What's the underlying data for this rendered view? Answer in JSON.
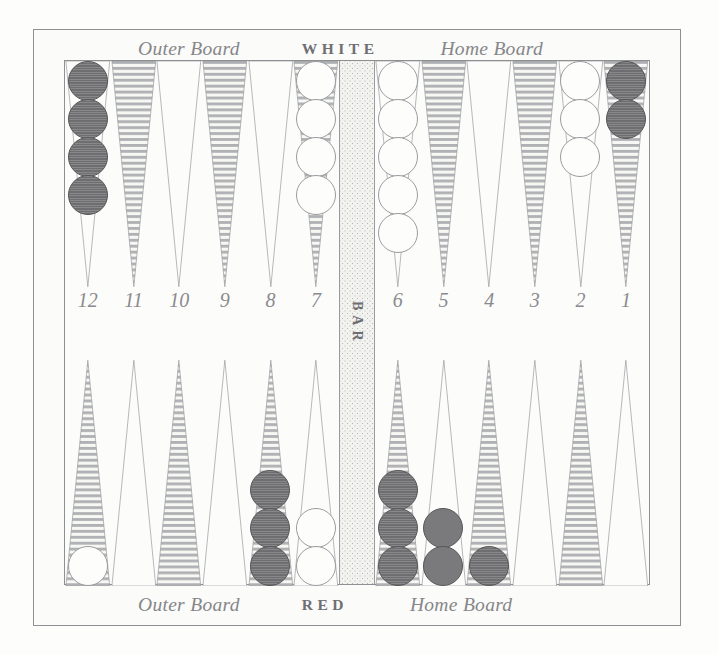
{
  "board": {
    "top_caption": {
      "outer": "Outer Board",
      "player": "WHITE",
      "home": "Home Board"
    },
    "bottom_caption": {
      "outer": "Outer Board",
      "player": "RED",
      "home": "Home Board"
    },
    "bar_label": "BAR",
    "point_numbers": [
      "12",
      "11",
      "10",
      "9",
      "8",
      "7",
      "6",
      "5",
      "4",
      "3",
      "2",
      "1"
    ],
    "colors": {
      "frame": "#8f9094",
      "paper": "#fbfbf9",
      "point_hatch": "#b0b1b4",
      "point_plain": "#fcfcfa",
      "checker_white": "#fdfdfb",
      "checker_red": "#6e6e70",
      "bar_stipple": "#b4b5b8",
      "text": "#86868a"
    },
    "top_points": [
      {
        "number": "12",
        "fill": "plain",
        "checkers": {
          "color": "red",
          "count": 4
        }
      },
      {
        "number": "11",
        "fill": "hatched",
        "checkers": {
          "color": "none",
          "count": 0
        }
      },
      {
        "number": "10",
        "fill": "plain",
        "checkers": {
          "color": "none",
          "count": 0
        }
      },
      {
        "number": "9",
        "fill": "hatched",
        "checkers": {
          "color": "none",
          "count": 0
        }
      },
      {
        "number": "8",
        "fill": "plain",
        "checkers": {
          "color": "none",
          "count": 0
        }
      },
      {
        "number": "7",
        "fill": "hatched",
        "checkers": {
          "color": "white",
          "count": 4
        }
      },
      {
        "number": "6",
        "fill": "plain",
        "checkers": {
          "color": "white",
          "count": 5
        }
      },
      {
        "number": "5",
        "fill": "hatched",
        "checkers": {
          "color": "none",
          "count": 0
        }
      },
      {
        "number": "4",
        "fill": "plain",
        "checkers": {
          "color": "none",
          "count": 0
        }
      },
      {
        "number": "3",
        "fill": "hatched",
        "checkers": {
          "color": "none",
          "count": 0
        }
      },
      {
        "number": "2",
        "fill": "plain",
        "checkers": {
          "color": "white",
          "count": 3
        }
      },
      {
        "number": "1",
        "fill": "hatched",
        "checkers": {
          "color": "red",
          "count": 2
        }
      }
    ],
    "bottom_points": [
      {
        "number": "12",
        "fill": "hatched",
        "checkers": {
          "color": "white",
          "count": 1
        }
      },
      {
        "number": "11",
        "fill": "plain",
        "checkers": {
          "color": "none",
          "count": 0
        }
      },
      {
        "number": "10",
        "fill": "hatched",
        "checkers": {
          "color": "none",
          "count": 0
        }
      },
      {
        "number": "9",
        "fill": "plain",
        "checkers": {
          "color": "none",
          "count": 0
        }
      },
      {
        "number": "8",
        "fill": "hatched",
        "checkers": {
          "color": "red",
          "count": 3
        }
      },
      {
        "number": "7",
        "fill": "plain",
        "checkers": {
          "color": "white",
          "count": 2
        }
      },
      {
        "number": "6",
        "fill": "hatched",
        "checkers": {
          "color": "red",
          "count": 3
        }
      },
      {
        "number": "5",
        "fill": "plain",
        "checkers": {
          "color": "red",
          "count": 2,
          "style": "plain"
        }
      },
      {
        "number": "4",
        "fill": "hatched",
        "checkers": {
          "color": "red",
          "count": 1
        }
      },
      {
        "number": "3",
        "fill": "plain",
        "checkers": {
          "color": "none",
          "count": 0
        }
      },
      {
        "number": "2",
        "fill": "hatched",
        "checkers": {
          "color": "none",
          "count": 0
        }
      },
      {
        "number": "1",
        "fill": "plain",
        "checkers": {
          "color": "none",
          "count": 0
        }
      }
    ]
  }
}
